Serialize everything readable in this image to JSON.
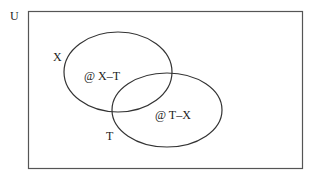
{
  "diagram": {
    "type": "venn",
    "universe": {
      "label": "U"
    },
    "sets": [
      {
        "name": "X",
        "label": "X"
      },
      {
        "name": "T",
        "label": "T"
      }
    ],
    "regions": [
      {
        "id": "x-minus-t",
        "label": "@ X–T"
      },
      {
        "id": "t-minus-x",
        "label": "@ T–X"
      }
    ],
    "colors": {
      "stroke": "#333333",
      "background": "#ffffff",
      "text": "#222222"
    }
  }
}
